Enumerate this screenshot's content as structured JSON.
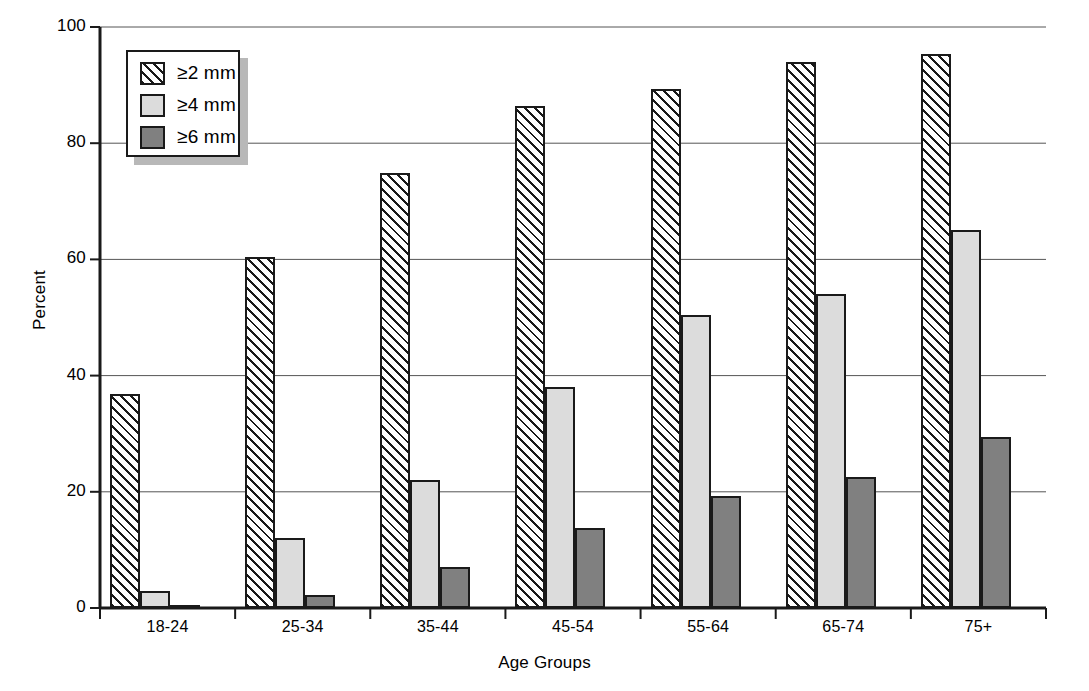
{
  "chart_data": {
    "type": "bar",
    "title": "",
    "xlabel": "Age Groups",
    "ylabel": "Percent",
    "categories": [
      "18-24",
      "25-34",
      "35-44",
      "45-54",
      "55-64",
      "65-74",
      "75+"
    ],
    "series": [
      {
        "name": "≥2 mm",
        "pattern": "diagonal-hatch",
        "color": "#ffffff",
        "values": [
          36.8,
          60.4,
          74.8,
          86.4,
          89.4,
          94.0,
          95.4
        ]
      },
      {
        "name": "≥4 mm",
        "pattern": "solid",
        "color": "#dcdcdc",
        "values": [
          3.0,
          12.0,
          22.1,
          38.0,
          50.4,
          54.0,
          65.0
        ]
      },
      {
        "name": "≥6 mm",
        "pattern": "solid",
        "color": "#808080",
        "values": [
          0.5,
          2.3,
          7.0,
          13.7,
          19.2,
          22.5,
          29.5
        ]
      }
    ],
    "ylim": [
      0,
      100
    ],
    "yticks": [
      0,
      20,
      40,
      60,
      80,
      100
    ],
    "ytick_labels": [
      "0",
      "20",
      "40",
      "60",
      "80",
      "100"
    ],
    "grid": "horizontal",
    "legend_position": "top-left-inside"
  },
  "legend": {
    "entries": [
      {
        "label": "≥2 mm"
      },
      {
        "label": "≥4 mm"
      },
      {
        "label": "≥6 mm"
      }
    ]
  },
  "axes": {
    "y_title": "Percent",
    "x_title": "Age Groups"
  }
}
